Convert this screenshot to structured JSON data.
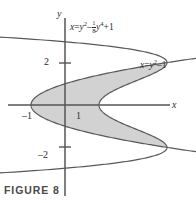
{
  "figure": {
    "caption": "FIGURE 8",
    "background_color": "#ffffff",
    "shade_color": "#d2d2d2",
    "curve_color": "#585858",
    "axis_color": "#555555",
    "text_color": "#2e2e2e"
  },
  "axes": {
    "x_label": "x",
    "y_label": "y",
    "x_ticks": [
      {
        "value": -1,
        "label": "–1"
      },
      {
        "value": 1,
        "label": "1"
      }
    ],
    "y_ticks": [
      {
        "value": 2,
        "label": "2"
      },
      {
        "value": -2,
        "label": "–2"
      }
    ]
  },
  "equations": {
    "quartic": {
      "lhs": "x",
      "eq": "=",
      "term1": "y",
      "term1_exp": "2",
      "minus": "–",
      "frac_num": "1",
      "frac_den": "8",
      "term2": "y",
      "term2_exp": "4",
      "plus": "+",
      "const": "1",
      "plain": "x = y2 – 1/8 y4 + 1"
    },
    "parabola": {
      "lhs": "x",
      "eq": "=",
      "term1": "y",
      "term1_exp": "2",
      "minus": "–",
      "const": "1",
      "plain": "x = y2 – 1"
    }
  },
  "chart_data": {
    "type": "line",
    "title": "FIGURE 8",
    "xlabel": "x",
    "ylabel": "y",
    "grid": false,
    "legend": "none",
    "xlim": [
      -1.9,
      3.9
    ],
    "ylim": [
      -4.6,
      4.6
    ],
    "origin_px": [
      65,
      105
    ],
    "px_per_unit_x": 34,
    "px_per_unit_y": 21.2,
    "series": [
      {
        "name": "x = y^2 - (1/8)y^4 + 1",
        "orientation": "x_of_y",
        "formula": "1 + y*y - (y*y*y*y)/8",
        "y_range": [
          -4.55,
          4.55
        ],
        "sample_points": [
          {
            "y": -4.5,
            "x": -29.53
          },
          {
            "y": -4.0,
            "x": -15.0
          },
          {
            "y": -3.5,
            "x": -5.5
          },
          {
            "y": -3.0,
            "x": -0.125
          },
          {
            "y": -2.5,
            "x": 2.37
          },
          {
            "y": -2.0,
            "x": 3.0
          },
          {
            "y": -1.5,
            "x": 2.62
          },
          {
            "y": -1.0,
            "x": 1.875
          },
          {
            "y": -0.5,
            "x": 1.242
          },
          {
            "y": 0.0,
            "x": 1.0
          },
          {
            "y": 0.5,
            "x": 1.242
          },
          {
            "y": 1.0,
            "x": 1.875
          },
          {
            "y": 1.5,
            "x": 2.62
          },
          {
            "y": 2.0,
            "x": 3.0
          },
          {
            "y": 2.5,
            "x": 2.37
          },
          {
            "y": 3.0,
            "x": -0.125
          },
          {
            "y": 3.5,
            "x": -5.5
          },
          {
            "y": 4.0,
            "x": -15.0
          },
          {
            "y": 4.5,
            "x": -29.53
          }
        ]
      },
      {
        "name": "x = y^2 - 1",
        "orientation": "x_of_y",
        "formula": "y*y - 1",
        "y_range": [
          -2.3,
          2.3
        ],
        "sample_points": [
          {
            "y": -2.2,
            "x": 3.84
          },
          {
            "y": -2.0,
            "x": 3.0
          },
          {
            "y": -1.5,
            "x": 1.25
          },
          {
            "y": -1.0,
            "x": 0.0
          },
          {
            "y": -0.5,
            "x": -0.75
          },
          {
            "y": 0.0,
            "x": -1.0
          },
          {
            "y": 0.5,
            "x": -0.75
          },
          {
            "y": 1.0,
            "x": 0.0
          },
          {
            "y": 1.5,
            "x": 1.25
          },
          {
            "y": 2.0,
            "x": 3.0
          },
          {
            "y": 2.2,
            "x": 3.84
          }
        ]
      }
    ],
    "shaded_region": {
      "description": "Region between x = y^2 - 1 (left boundary) and x = y^2 - (1/8)y^4 + 1 (right boundary) for -2 <= y <= 2",
      "y_from": -2,
      "y_to": 2,
      "left_curve": "x = y^2 - 1",
      "right_curve": "x = y^2 - (1/8)y^4 + 1",
      "fill": "#d2d2d2"
    },
    "intersections": [
      {
        "x": 3,
        "y": 2
      },
      {
        "x": 3,
        "y": -2
      }
    ],
    "annotations": [
      {
        "text": "x = y2 - 1/8 y4 + 1",
        "x_px": 70,
        "y_px": 20
      },
      {
        "text": "x = y2 - 1",
        "x_px": 140,
        "y_px": 59
      }
    ]
  }
}
